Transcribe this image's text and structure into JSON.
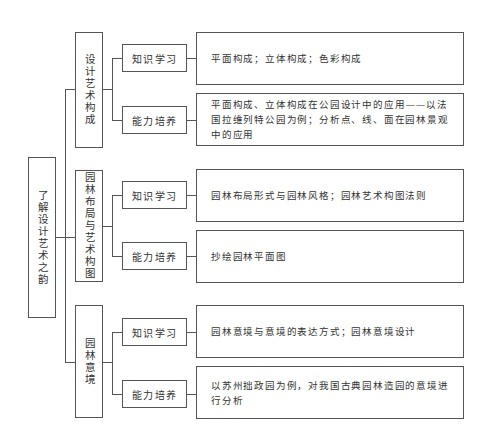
{
  "root": {
    "label": "了解设计艺术之韵"
  },
  "branches": [
    {
      "label": "设计艺术构成",
      "children": [
        {
          "type": "知识学习",
          "content": "平面构成；立体构成；色彩构成"
        },
        {
          "type": "能力培养",
          "content": "平面构成、立体构成在公园设计中的应用——以法国拉维列特公园为例；分析点、线、面在园林景观中的应用"
        }
      ]
    },
    {
      "label": "园林布局与艺术构图",
      "children": [
        {
          "type": "知识学习",
          "content": "园林布局形式与园林风格；园林艺术构图法则"
        },
        {
          "type": "能力培养",
          "content": "抄绘园林平面图"
        }
      ]
    },
    {
      "label": "园林意境",
      "children": [
        {
          "type": "知识学习",
          "content": "园林意境与意境的表达方式；园林意境设计"
        },
        {
          "type": "能力培养",
          "content": "以苏州拙政园为例，对我国古典园林造园的意境进行分析"
        }
      ]
    }
  ]
}
